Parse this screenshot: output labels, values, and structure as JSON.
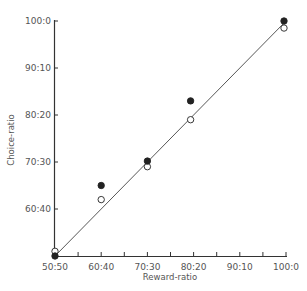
{
  "chart_data": {
    "type": "scatter",
    "title": "",
    "xlabel": "Reward-ratio",
    "ylabel": "Choice-ratio",
    "x_ticks": [
      "50:50",
      "60:40",
      "70:30",
      "80:20",
      "90:10",
      "100:0"
    ],
    "y_ticks": [
      "50:50",
      "60:40",
      "70:30",
      "80:20",
      "90:10",
      "100:0"
    ],
    "xlim": [
      50,
      100
    ],
    "ylim": [
      50,
      100
    ],
    "grid": false,
    "legend": null,
    "reference_line": {
      "label": "matching line",
      "from": [
        50,
        50
      ],
      "to": [
        100,
        100
      ]
    },
    "series": [
      {
        "name": "filled circles",
        "marker": "filled-circle",
        "x": [
          50,
          60,
          70,
          80,
          100
        ],
        "y": [
          50,
          65,
          70.2,
          83,
          100
        ]
      },
      {
        "name": "open circles",
        "marker": "open-circle",
        "x": [
          50,
          60,
          70,
          80,
          100
        ],
        "y": [
          51,
          62,
          69,
          79,
          98.5
        ]
      }
    ]
  },
  "labels": {
    "xlabel": "Reward-ratio",
    "ylabel": "Choice-ratio"
  }
}
